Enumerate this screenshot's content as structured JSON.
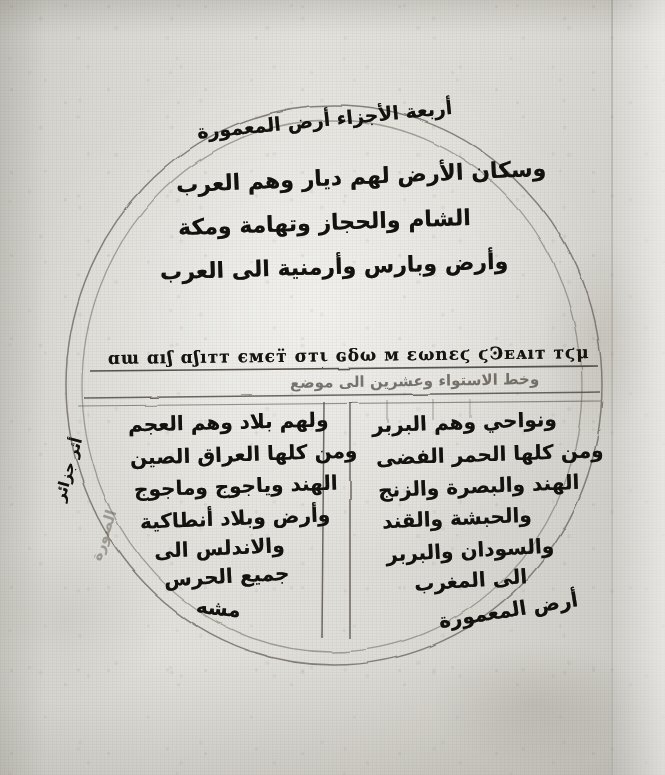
{
  "document": {
    "kind": "manuscript-folio",
    "description": "Circular world map (mappa mundi) diagram drawn in ink on parchment",
    "palette": {
      "parchment": "#ddd",
      "ink": "#14120f",
      "faint_ink": "#4b463e",
      "rule_line": "#6b655b"
    }
  },
  "map": {
    "circle": {
      "label": "world-circle",
      "cx": 334,
      "cy": 384,
      "rx": 266,
      "ry": 279
    },
    "heading": {
      "text": "أربعة الأجزاء أرض المعمورة",
      "transliteration": "arba'at al-ajza' ard al-ma'mura"
    },
    "north_hemisphere": {
      "lines": [
        "وسكان الأرض لهم ديار وهم العرب",
        "الشام والحجاز وتهامة ومكة",
        "وأرض وبارس وأرمنية الى العرب"
      ]
    },
    "equator_band": {
      "script_line": {
        "script": "greek-coptic-hand",
        "text": "ɑɯ ɑıʃ ɑʃıᴛᴛ ємєᴛ̈ σᴛι ɢδω ᴍ ɛωnɛϛ ϛϿᴇᴀıᴛ ᴛϛμ"
      },
      "under_line": {
        "text": "وخط الاستواء وعشرين الى موضع",
        "style": "faint"
      }
    },
    "south_west_quadrant": {
      "lines": [
        "ولهم بلاد وهم العجم",
        "ومن كلها العراق الصين",
        "الهند وياجوج وماجوج",
        "وأرض وبلاد أنطاكية",
        "والاندلس الى",
        "جميع الحرس"
      ]
    },
    "south_east_quadrant": {
      "lines": [
        "ونواحي وهم البربر",
        "ومن كلها الحمر الفضى",
        "الهند والبصرة والزنج",
        "والحبشة والقند",
        "والسودان والبربر",
        "الى المغرب"
      ]
    },
    "corner_labels": {
      "bottom_right": "أرض المعمورة",
      "bottom_left": "مشه",
      "left_margin_vertical": "أثر جزائر",
      "left_inner_vertical": "الصورة"
    }
  }
}
